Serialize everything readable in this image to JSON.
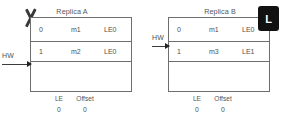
{
  "diagram": {
    "replicas": [
      {
        "id": "replica-a",
        "title": "Replica A",
        "role_badge": null,
        "failed": true,
        "failure_marker": "x-mark",
        "columns": [
          "Offset",
          "Message",
          "LeaderEpoch"
        ],
        "rows": [
          {
            "offset": "0",
            "message": "m1",
            "leader_epoch": "LE0"
          },
          {
            "offset": "1",
            "message": "m2",
            "leader_epoch": "LE0"
          },
          {
            "offset": "",
            "message": "",
            "leader_epoch": ""
          }
        ],
        "hw_label": "HW",
        "hw_row_index": 2,
        "meta": {
          "le_label": "LE",
          "le_value": "0",
          "offset_label": "Offset",
          "offset_value": "0"
        }
      },
      {
        "id": "replica-b",
        "title": "Replica B",
        "role_badge": "L",
        "failed": false,
        "failure_marker": null,
        "columns": [
          "Offset",
          "Message",
          "LeaderEpoch"
        ],
        "rows": [
          {
            "offset": "0",
            "message": "m1",
            "leader_epoch": "LE0"
          },
          {
            "offset": "1",
            "message": "m3",
            "leader_epoch": "LE1"
          },
          {
            "offset": "",
            "message": "",
            "leader_epoch": ""
          }
        ],
        "hw_label": "HW",
        "hw_row_index": 1,
        "meta": {
          "le_label": "LE",
          "le_value": "0",
          "offset_label": "Offset",
          "offset_value": "0"
        }
      }
    ],
    "colors": {
      "background": "#ffffff",
      "border": "#6e6e6e",
      "text": "#4f4f4f",
      "badge_background": "#111111",
      "badge_text": "#ffffff",
      "arrow": "#222222"
    }
  }
}
